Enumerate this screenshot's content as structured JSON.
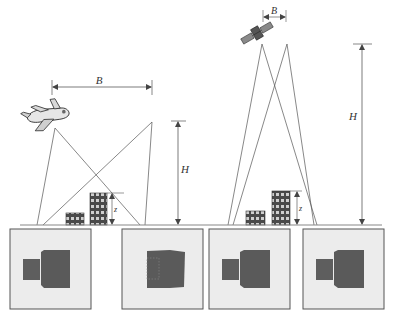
{
  "figure": {
    "left_scene": {
      "platform": "airplane",
      "labels": {
        "baseline": "B",
        "height": "H",
        "relief": "z"
      }
    },
    "right_scene": {
      "platform": "satellite",
      "labels": {
        "baseline": "B",
        "height": "H",
        "relief": "z"
      }
    },
    "image_panels": [
      {
        "id": 1,
        "scene": "left",
        "shows": "building with offset lower block (large parallax)"
      },
      {
        "id": 2,
        "scene": "left",
        "shows": "building with lower block merged, dotted outline"
      },
      {
        "id": 3,
        "scene": "right",
        "shows": "building with offset lower block"
      },
      {
        "id": 4,
        "scene": "right",
        "shows": "building with offset lower block"
      }
    ],
    "colors": {
      "line": "#555555",
      "panel_fill": "#ececec",
      "panel_border": "#555555",
      "building_dark": "#5a5a5a",
      "ground": "#888888"
    }
  }
}
